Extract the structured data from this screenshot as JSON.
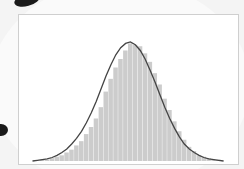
{
  "chart_data": {
    "type": "bar",
    "title": "",
    "xlabel": "",
    "ylabel": "",
    "overlay": {
      "type": "line",
      "name": "normal-fit",
      "color": "#444444"
    },
    "bar_color": "#cccccc",
    "categories": [
      1,
      2,
      3,
      4,
      5,
      6,
      7,
      8,
      9,
      10,
      11,
      12,
      13,
      14,
      15,
      16,
      17,
      18,
      19,
      20,
      21,
      22,
      23,
      24,
      25,
      26,
      27,
      28,
      29,
      30,
      31,
      32,
      33,
      34,
      35,
      36,
      37,
      38,
      39,
      40
    ],
    "values": [
      0,
      0,
      1,
      1,
      2,
      3,
      4,
      6,
      8,
      11,
      14,
      19,
      24,
      30,
      38,
      49,
      58,
      66,
      72,
      78,
      83,
      82,
      81,
      76,
      70,
      62,
      54,
      44,
      36,
      28,
      21,
      15,
      10,
      7,
      4,
      3,
      2,
      1,
      1,
      0
    ],
    "curve": [
      0,
      0.5,
      1,
      1.5,
      2.5,
      4,
      6,
      8.5,
      12,
      16,
      21,
      27,
      34,
      42,
      51,
      60,
      68,
      75,
      80,
      83,
      84,
      82,
      78,
      72,
      64,
      56,
      47,
      38,
      30,
      23,
      17,
      12,
      8.5,
      6,
      4,
      2.5,
      1.5,
      1,
      0.5,
      0
    ],
    "ylim": [
      0,
      100
    ]
  }
}
